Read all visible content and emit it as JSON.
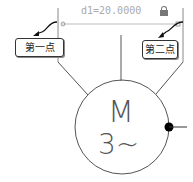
{
  "dimension": {
    "label": "d1=20.0000",
    "lock_icon": "lock-icon"
  },
  "callouts": [
    {
      "label": "第一点"
    },
    {
      "label": "第二点"
    }
  ],
  "motor": {
    "symbol": "M",
    "phase": "3~"
  },
  "colors": {
    "line": "#555555",
    "dimension": "#aaaaaa",
    "dot": "#000000"
  }
}
